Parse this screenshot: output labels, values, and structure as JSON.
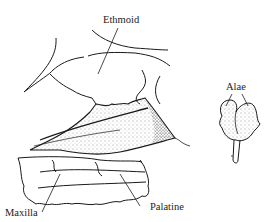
{
  "diagram": {
    "type": "anatomical line drawing",
    "labels": {
      "ethmoid": "Ethmoid",
      "alae": "Alae",
      "maxilla": "Maxilla",
      "palatine": "Palatine"
    },
    "colors": {
      "ink": "#1a1a1a",
      "background": "#ffffff"
    }
  }
}
